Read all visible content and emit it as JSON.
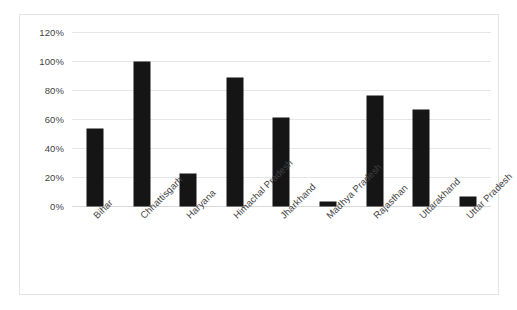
{
  "chart_data": {
    "type": "bar",
    "title": "",
    "subtitle": "",
    "xlabel": "",
    "ylabel": "",
    "categories": [
      "Bihar",
      "Chhattisgarh",
      "Haryana",
      "Himachal Pradesh",
      "Jharkhand",
      "Madhya Pradesh",
      "Rajasthan",
      "Uttarakhand",
      "Uttar Pradesh"
    ],
    "values": [
      53,
      99,
      22,
      88,
      61,
      3,
      76,
      66,
      6
    ],
    "ylim": [
      0,
      120
    ],
    "ytick_values": [
      0,
      20,
      40,
      60,
      80,
      100,
      120
    ],
    "ytick_labels": [
      "0%",
      "20%",
      "40%",
      "60%",
      "80%",
      "100%",
      "120%"
    ],
    "grid": true,
    "legend": false,
    "legend_position": "none",
    "bar_color": "#151515",
    "gridline_color": "#e6e6e6",
    "axis_text_color": "#3f3f3f",
    "plot_background": "#ffffff",
    "border_color": "#e3e3e3",
    "xtick_rotation_degrees": -45,
    "annotations": []
  }
}
